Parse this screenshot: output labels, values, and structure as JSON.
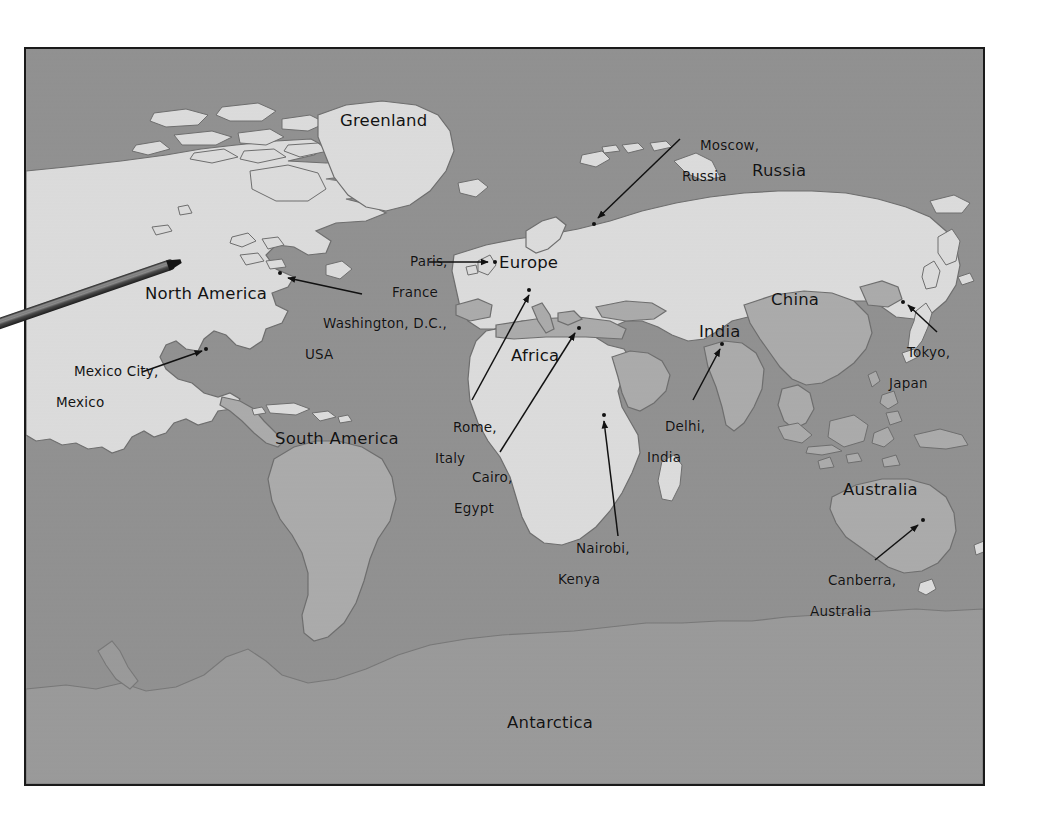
{
  "document": {
    "type": "world-map-photograph",
    "background_color": "#ffffff"
  },
  "map": {
    "frame_border_color": "#1a1a1a",
    "ocean_color": "#919191",
    "land_light_color": "#dcdcdc",
    "land_mid_color": "#ababab",
    "coastline_color": "#6e6e6e",
    "label_color": "#131313"
  },
  "pointer": {
    "name": "pointer-stick",
    "description": "wooden pointing stick entering from the left edge, tip resting on western North America",
    "color_dark": "#2b2b2b",
    "color_light": "#7d7d7d"
  },
  "continents": [
    {
      "id": "greenland",
      "label": "Greenland",
      "x": 338,
      "y": 110
    },
    {
      "id": "north-america",
      "label": "North America",
      "x": 143,
      "y": 283
    },
    {
      "id": "south-america",
      "label": "South America",
      "x": 273,
      "y": 428
    },
    {
      "id": "europe",
      "label": "Europe",
      "x": 497,
      "y": 252
    },
    {
      "id": "africa",
      "label": "Africa",
      "x": 509,
      "y": 345
    },
    {
      "id": "russia",
      "label": "Russia",
      "x": 750,
      "y": 160
    },
    {
      "id": "china",
      "label": "China",
      "x": 769,
      "y": 289
    },
    {
      "id": "india",
      "label": "India",
      "x": 697,
      "y": 321
    },
    {
      "id": "australia",
      "label": "Australia",
      "x": 841,
      "y": 479
    },
    {
      "id": "antarctica",
      "label": "Antarctica",
      "x": 505,
      "y": 712
    }
  ],
  "cities": [
    {
      "id": "washington-dc",
      "line1": "Washington, D.C.,",
      "line2": "USA",
      "label_x": 303,
      "label_y": 298,
      "dot_x": 276,
      "dot_y": 269,
      "arrow": {
        "x1": 360,
        "y1": 292,
        "x2": 288,
        "y2": 276
      }
    },
    {
      "id": "mexico-city",
      "line1": "Mexico City,",
      "line2": "Mexico",
      "label_x": 54,
      "label_y": 346,
      "dot_x": 202,
      "dot_y": 345,
      "arrow": {
        "x1": 140,
        "y1": 370,
        "x2": 196,
        "y2": 349
      }
    },
    {
      "id": "paris-france",
      "line1": "Paris,",
      "line2": "France",
      "label_x": 390,
      "label_y": 236,
      "dot_x": 491,
      "dot_y": 258,
      "arrow": {
        "x1": 447,
        "y1": 258,
        "x2": 487,
        "y2": 258
      }
    },
    {
      "id": "moscow-russia",
      "line1": "Moscow,",
      "line2": "Russia",
      "label_x": 680,
      "label_y": 120,
      "dot_x": 590,
      "dot_y": 220,
      "arrow": {
        "x1": 678,
        "y1": 137,
        "x2": 596,
        "y2": 216
      }
    },
    {
      "id": "rome-italy",
      "line1": "Rome,",
      "line2": "Italy",
      "label_x": 433,
      "label_y": 402,
      "dot_x": 525,
      "dot_y": 286,
      "arrow": {
        "x1": 470,
        "y1": 398,
        "x2": 526,
        "y2": 293
      }
    },
    {
      "id": "cairo-egypt",
      "line1": "Cairo,",
      "line2": "Egypt",
      "label_x": 452,
      "label_y": 452,
      "dot_x": 575,
      "dot_y": 324,
      "arrow": {
        "x1": 498,
        "y1": 450,
        "x2": 571,
        "y2": 331
      }
    },
    {
      "id": "nairobi-kenya",
      "line1": "Nairobi,",
      "line2": "Kenya",
      "label_x": 556,
      "label_y": 523,
      "dot_x": 600,
      "dot_y": 411,
      "arrow": {
        "x1": 616,
        "y1": 534,
        "x2": 600,
        "y2": 419
      }
    },
    {
      "id": "delhi-india",
      "line1": "Delhi,",
      "line2": "India",
      "label_x": 645,
      "label_y": 401,
      "dot_x": 718,
      "dot_y": 340,
      "arrow": {
        "x1": 691,
        "y1": 398,
        "x2": 717,
        "y2": 347
      }
    },
    {
      "id": "tokyo-japan",
      "line1": "Tokyo,",
      "line2": "Japan",
      "label_x": 887,
      "label_y": 327,
      "dot_x": 899,
      "dot_y": 298,
      "arrow": {
        "x1": 935,
        "y1": 330,
        "x2": 905,
        "y2": 303
      }
    },
    {
      "id": "canberra-australia",
      "line1": "Canberra,",
      "line2": "Australia",
      "label_x": 808,
      "label_y": 555,
      "dot_x": 919,
      "dot_y": 516,
      "arrow": {
        "x1": 873,
        "y1": 558,
        "x2": 915,
        "y2": 523
      }
    }
  ]
}
